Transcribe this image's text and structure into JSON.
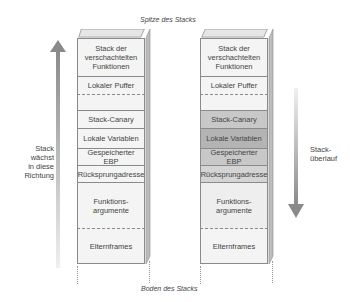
{
  "captions": {
    "top": "Spitze des Stacks",
    "bottom": "Boden des Stacks"
  },
  "left_arrow": {
    "direction": "up",
    "label_lines": [
      "Stack",
      "wächst",
      "in diese",
      "Richtung"
    ]
  },
  "right_arrow": {
    "direction": "down",
    "label_lines": [
      "Stack-",
      "überlauf"
    ]
  },
  "stacks": [
    {
      "name": "normal",
      "segments": [
        {
          "label_lines": [
            "Stack der",
            "verschachtelten",
            "Funktionen"
          ],
          "fill": "#f4f4f4"
        },
        {
          "label_lines": [
            "Lokaler Puffer"
          ],
          "fill": "#f4f4f4"
        },
        {
          "label_lines": [
            ""
          ],
          "fill": "#f4f4f4"
        },
        {
          "label_lines": [
            "Stack-Canary"
          ],
          "fill": "#f4f4f4"
        },
        {
          "label_lines": [
            "Lokale Variablen"
          ],
          "fill": "#f4f4f4"
        },
        {
          "label_lines": [
            "Gespeicherter EBP"
          ],
          "fill": "#f4f4f4"
        },
        {
          "label_lines": [
            "Rücksprungadresse"
          ],
          "fill": "#f4f4f4"
        },
        {
          "label_lines": [
            "Funktions-",
            "argumente"
          ],
          "fill": "#f4f4f4"
        },
        {
          "label_lines": [
            "Elternframes"
          ],
          "fill": "#f4f4f4"
        }
      ]
    },
    {
      "name": "overflow",
      "segments": [
        {
          "label_lines": [
            "Stack der",
            "verschachtelten",
            "Funktionen"
          ],
          "fill": "#f4f4f4"
        },
        {
          "label_lines": [
            "Lokaler Puffer"
          ],
          "fill": "#f4f4f4"
        },
        {
          "label_lines": [
            ""
          ],
          "fill": "#f4f4f4"
        },
        {
          "label_lines": [
            "Stack-Canary"
          ],
          "fill": "#c8c8c8"
        },
        {
          "label_lines": [
            "Lokale Variablen"
          ],
          "fill": "#b4b4b4"
        },
        {
          "label_lines": [
            "Gespeicherter EBP"
          ],
          "fill": "#c8c8c8"
        },
        {
          "label_lines": [
            "Rücksprungadresse"
          ],
          "fill": "#d4d4d4"
        },
        {
          "label_lines": [
            "Funktions-",
            "argumente"
          ],
          "fill": "#eeeeee"
        },
        {
          "label_lines": [
            "Elternframes"
          ],
          "fill": "#f4f4f4"
        }
      ]
    }
  ]
}
